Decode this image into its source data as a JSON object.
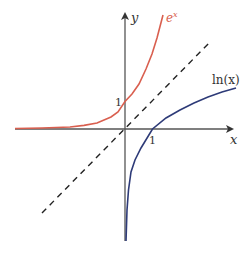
{
  "figure": {
    "axes": {
      "x_label": "x",
      "y_label": "y",
      "x_tick": "1",
      "y_tick": "1"
    },
    "curves": [
      {
        "name": "exp",
        "label": "e",
        "label_sup": "x",
        "color": "#d95f4f"
      },
      {
        "name": "ln",
        "label": "ln(x)",
        "color": "#2e3b78"
      },
      {
        "name": "identity",
        "label": "y = x",
        "color": "#222222",
        "style": "dashed"
      }
    ],
    "colors": {
      "axis": "#555555",
      "exp": "#d95f4f",
      "ln": "#2e3b78",
      "dashed": "#222222"
    }
  }
}
